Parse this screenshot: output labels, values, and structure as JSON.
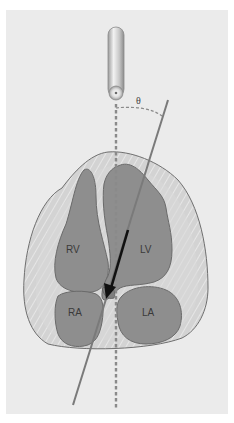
{
  "figure": {
    "type": "echocardiography Doppler angle schematic",
    "angle_label": "θ",
    "chambers": [
      {
        "id": "rv",
        "label": "RV"
      },
      {
        "id": "lv",
        "label": "LV"
      },
      {
        "id": "ra",
        "label": "RA"
      },
      {
        "id": "la",
        "label": "LA"
      }
    ],
    "elements": {
      "probe": "ultrasound transducer",
      "beam_line": "dashed vertical ultrasound beam",
      "flow_line": "diagonal blood-flow direction line",
      "flow_arrow": "flow direction arrow"
    }
  },
  "colors": {
    "panel_bg": "#ebebeb",
    "pericardium": "#d6d6d6",
    "myocardium_fill": "#cfcfcf",
    "chamber_fill": "#8e8e8e",
    "outline": "#6a6a6a",
    "flow_line": "#7a7a7a",
    "arrow": "#111111",
    "beam": "#8a8a8a"
  }
}
